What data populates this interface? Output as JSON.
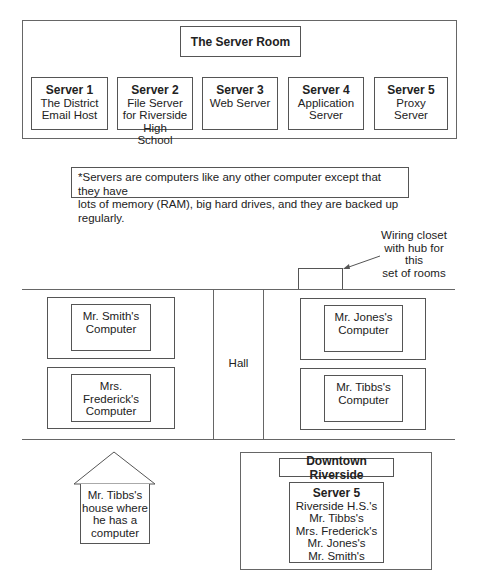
{
  "server_room": {
    "title": "The Server Room",
    "servers": [
      {
        "name": "Server 1",
        "lines": [
          "The District",
          "Email Host"
        ]
      },
      {
        "name": "Server 2",
        "lines": [
          "File Server",
          "for Riverside",
          "High",
          "School"
        ]
      },
      {
        "name": "Server 3",
        "lines": [
          "Web Server"
        ]
      },
      {
        "name": "Server 4",
        "lines": [
          "Application",
          "Server"
        ]
      },
      {
        "name": "Server 5",
        "lines": [
          "Proxy",
          "Server"
        ]
      }
    ],
    "note_line1": "*Servers are computers like any other computer except that they have",
    "note_line2": "lots of memory (RAM), big hard drives, and they are backed up regularly."
  },
  "building": {
    "wiring_closet_label": [
      "Wiring closet",
      "with hub for this",
      "set of rooms"
    ],
    "hall_label": "Hall",
    "left_rooms": [
      {
        "lines": [
          "Mr. Smith's",
          "Computer"
        ]
      },
      {
        "lines": [
          "Mrs. Frederick's",
          "Computer"
        ]
      }
    ],
    "right_rooms": [
      {
        "lines": [
          "Mr. Jones's",
          "Computer"
        ]
      },
      {
        "lines": [
          "Mr. Tibbs's",
          "Computer"
        ]
      }
    ]
  },
  "house": {
    "lines": [
      "Mr. Tibbs's",
      "house where",
      "he has a",
      "computer"
    ]
  },
  "downtown": {
    "title": "Downtown Riverside",
    "server_name": "Server 5",
    "lines": [
      "Riverside H.S.'s",
      "Mr. Tibbs's",
      "Mrs. Frederick's",
      "Mr. Jones's",
      "Mr. Smith's"
    ]
  },
  "colors": {
    "line": "#666666",
    "text": "#222222",
    "background": "#ffffff"
  }
}
